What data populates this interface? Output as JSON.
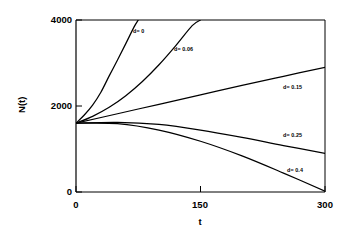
{
  "chart_data": {
    "type": "line",
    "title": "",
    "subtitle": "",
    "xlabel": "t",
    "ylabel": "N(t)",
    "xlim": [
      0,
      300
    ],
    "ylim": [
      0,
      4000
    ],
    "xticks": [
      "0",
      "150",
      "300"
    ],
    "xtick_values": [
      0,
      150,
      300
    ],
    "yticks": [
      "0",
      "2000",
      "4000"
    ],
    "ytick_values": [
      0,
      2000,
      4000
    ],
    "grid": false,
    "legend": "inline-curve-labels",
    "n0": 1600,
    "series": [
      {
        "name": "d= 0",
        "label": "d= 0",
        "d": 0,
        "color": "#000000",
        "x": [
          0,
          10,
          20,
          30,
          40,
          50,
          60,
          70,
          75
        ],
        "values": [
          1600,
          1790,
          2020,
          2320,
          2700,
          3070,
          3450,
          3840,
          4000
        ]
      },
      {
        "name": "d= 0.06",
        "label": "d= 0.06",
        "d": 0.06,
        "color": "#000000",
        "x": [
          0,
          20,
          40,
          60,
          80,
          100,
          120,
          140,
          150
        ],
        "values": [
          1600,
          1760,
          1970,
          2240,
          2570,
          2960,
          3400,
          3870,
          4000
        ]
      },
      {
        "name": "d= 0.15",
        "label": "d= 0.15",
        "d": 0.15,
        "color": "#000000",
        "x": [
          0,
          50,
          100,
          150,
          200,
          250,
          300
        ],
        "values": [
          1600,
          1820,
          2040,
          2260,
          2480,
          2690,
          2900
        ]
      },
      {
        "name": "d= 0.25",
        "label": "d= 0.25",
        "d": 0.25,
        "color": "#000000",
        "x": [
          0,
          50,
          100,
          150,
          200,
          250,
          300
        ],
        "values": [
          1600,
          1620,
          1570,
          1440,
          1270,
          1080,
          900
        ]
      },
      {
        "name": "d= 0.4",
        "label": "d= 0.4",
        "d": 0.4,
        "color": "#000000",
        "x": [
          0,
          50,
          100,
          150,
          200,
          250,
          300
        ],
        "values": [
          1600,
          1590,
          1440,
          1180,
          840,
          440,
          20
        ]
      }
    ],
    "curve_label_positions": [
      {
        "label": "d= 0",
        "x": 133,
        "y": 29
      },
      {
        "label": "d= 0.06",
        "x": 174,
        "y": 47
      },
      {
        "label": "d= 0.15",
        "x": 283,
        "y": 85
      },
      {
        "label": "d= 0.25",
        "x": 283,
        "y": 133
      },
      {
        "label": "d= 0.4",
        "x": 287,
        "y": 168
      }
    ]
  }
}
